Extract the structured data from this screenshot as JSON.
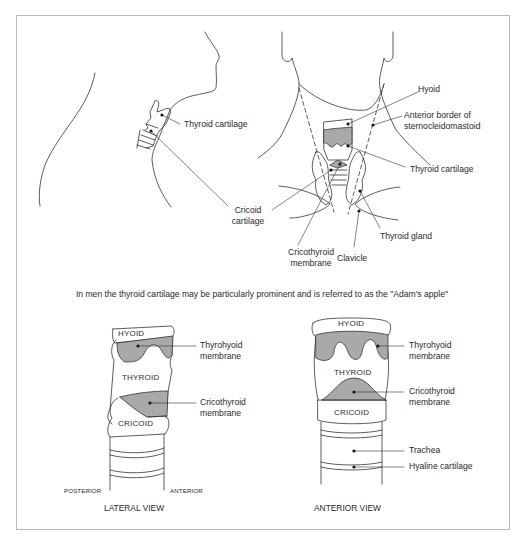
{
  "figure": {
    "caption": "In men the thyroid cartilage may be particularly prominent and is referred to as the \"Adam's apple\"",
    "colors": {
      "line": "#333333",
      "membrane_fill": "#a9a9a9",
      "frame": "#b8b8b8",
      "background": "#ffffff"
    },
    "side_profile": {
      "labels": {
        "thyroid_cartilage": "Thyroid cartilage"
      }
    },
    "front_neck": {
      "labels": {
        "hyoid": "Hyoid",
        "anterior_border_1": "Anterior border of",
        "anterior_border_2": "sternocleidomastoid",
        "thyroid_cartilage": "Thyroid cartilage",
        "cricoid_1": "Cricoid",
        "cricoid_2": "cartilage",
        "thyroid_gland": "Thyroid gland",
        "cricothyroid_1": "Cricothyroid",
        "cricothyroid_2": "membrane",
        "clavicle": "Clavicle"
      }
    },
    "lateral_view": {
      "title": "LATERAL VIEW",
      "parts": {
        "hyoid": "HYOID",
        "thyroid": "THYROID",
        "cricoid": "CRICOID"
      },
      "labels": {
        "thyrohyoid_1": "Thyrohyoid",
        "thyrohyoid_2": "membrane",
        "cricothyroid_1": "Cricothyroid",
        "cricothyroid_2": "membrane"
      },
      "orientation": {
        "posterior": "POSTERIOR",
        "anterior": "ANTERIOR"
      }
    },
    "anterior_view": {
      "title": "ANTERIOR VIEW",
      "parts": {
        "hyoid": "HYOID",
        "thyroid": "THYROID",
        "cricoid": "CRICOID"
      },
      "labels": {
        "thyrohyoid_1": "Thyrohyoid",
        "thyrohyoid_2": "membrane",
        "cricothyroid_1": "Cricothyroid",
        "cricothyroid_2": "membrane",
        "trachea": "Trachea",
        "hyaline": "Hyaline cartilage"
      }
    }
  }
}
